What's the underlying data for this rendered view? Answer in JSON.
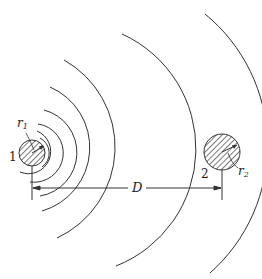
{
  "diagram": {
    "conductor1": {
      "label": "1",
      "radius_label": "r",
      "radius_sub": "1",
      "cx": 32,
      "cy": 153,
      "r": 13
    },
    "conductor2": {
      "label": "2",
      "radius_label": "r",
      "radius_sub": "2",
      "cx": 222,
      "cy": 152,
      "r": 18
    },
    "flux_line_radii": [
      17,
      22,
      29,
      44,
      62,
      98,
      158
    ],
    "dimension": {
      "label": "D"
    },
    "stroke_color": "#333333"
  }
}
